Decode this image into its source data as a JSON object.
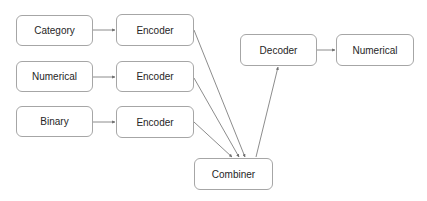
{
  "diagram": {
    "nodes": {
      "category": {
        "label": "Category"
      },
      "numerical_in": {
        "label": "Numerical"
      },
      "binary": {
        "label": "Binary"
      },
      "encoder1": {
        "label": "Encoder"
      },
      "encoder2": {
        "label": "Encoder"
      },
      "encoder3": {
        "label": "Encoder"
      },
      "combiner": {
        "label": "Combiner"
      },
      "decoder": {
        "label": "Decoder"
      },
      "numerical_out": {
        "label": "Numerical"
      }
    },
    "edges": [
      {
        "from": "category",
        "to": "encoder1"
      },
      {
        "from": "numerical_in",
        "to": "encoder2"
      },
      {
        "from": "binary",
        "to": "encoder3"
      },
      {
        "from": "encoder1",
        "to": "combiner"
      },
      {
        "from": "encoder2",
        "to": "combiner"
      },
      {
        "from": "encoder3",
        "to": "combiner"
      },
      {
        "from": "combiner",
        "to": "decoder"
      },
      {
        "from": "decoder",
        "to": "numerical_out"
      }
    ]
  }
}
